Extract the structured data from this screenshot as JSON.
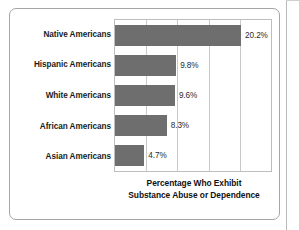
{
  "figure": {
    "caption_line1": "Percentage Who Exhibit",
    "caption_line2": "Substance Abuse or Dependence"
  },
  "style": {
    "bar_color": "#6e6e6e",
    "plot_background": "#ffffff",
    "gridline_color": "#c9c9c9",
    "frame_color": "#a6a6a6",
    "text_color": "#1b1b1b"
  },
  "chart_data": {
    "type": "bar",
    "orientation": "horizontal",
    "title": "Percentage Who Exhibit Substance Abuse or Dependence",
    "xlabel": "",
    "ylabel": "",
    "categories": [
      "Native Americans",
      "Hispanic Americans",
      "White Americans",
      "African Americans",
      "Asian Americans"
    ],
    "values": [
      20.2,
      9.8,
      9.6,
      8.3,
      4.7
    ],
    "value_labels": [
      "20.2%",
      "9.8%",
      "9.6%",
      "8.3%",
      "4.7%"
    ],
    "xlim": [
      0,
      25
    ],
    "xticks": [
      0,
      5,
      10,
      15,
      20,
      25
    ],
    "grid": true,
    "legend": "none",
    "units": "percent"
  }
}
